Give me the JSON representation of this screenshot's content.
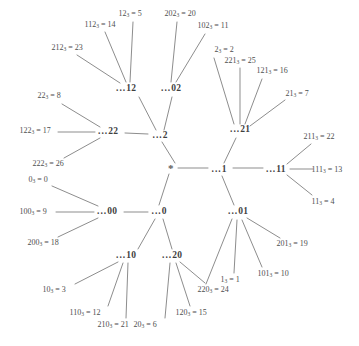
{
  "diagram": {
    "root": {
      "label": "*",
      "x": 171,
      "y": 168
    },
    "line_color": "#8d8d8d",
    "text_color": "#4b4b4b",
    "nodes": [
      {
        "name": "node-2",
        "dots": "...",
        "digits": "2",
        "x": 160,
        "y": 136
      },
      {
        "name": "node-22",
        "dots": "...",
        "digits": "22",
        "x": 108,
        "y": 132
      },
      {
        "name": "node-12",
        "dots": "...",
        "digits": "12",
        "x": 126,
        "y": 89
      },
      {
        "name": "node-02",
        "dots": "...",
        "digits": "02",
        "x": 171,
        "y": 89
      },
      {
        "name": "node-1",
        "dots": "...",
        "digits": "1",
        "x": 219,
        "y": 170
      },
      {
        "name": "node-21",
        "dots": "...",
        "digits": "21",
        "x": 240,
        "y": 130
      },
      {
        "name": "node-11",
        "dots": "...",
        "digits": "11",
        "x": 276,
        "y": 170
      },
      {
        "name": "node-01",
        "dots": "...",
        "digits": "01",
        "x": 238,
        "y": 212
      },
      {
        "name": "node-0",
        "dots": "...",
        "digits": "0",
        "x": 159,
        "y": 212
      },
      {
        "name": "node-00",
        "dots": "...",
        "digits": "00",
        "x": 107,
        "y": 212
      },
      {
        "name": "node-10",
        "dots": "...",
        "digits": "10",
        "x": 126,
        "y": 256
      },
      {
        "name": "node-20",
        "dots": "...",
        "digits": "20",
        "x": 172,
        "y": 256
      }
    ],
    "leaves": [
      {
        "name": "leaf-12",
        "base": "12",
        "value": "5",
        "x": 130,
        "y": 14,
        "anchor": "mid"
      },
      {
        "name": "leaf-112",
        "base": "112",
        "value": "14",
        "x": 100,
        "y": 25,
        "anchor": "mid"
      },
      {
        "name": "leaf-212",
        "base": "212",
        "value": "23",
        "x": 67,
        "y": 48,
        "anchor": "mid"
      },
      {
        "name": "leaf-202",
        "base": "202",
        "value": "20",
        "x": 180,
        "y": 14,
        "anchor": "mid"
      },
      {
        "name": "leaf-102",
        "base": "102",
        "value": "11",
        "x": 213,
        "y": 26,
        "anchor": "mid"
      },
      {
        "name": "leaf-2",
        "base": "2",
        "value": "2",
        "x": 224,
        "y": 50,
        "anchor": "mid"
      },
      {
        "name": "leaf-221",
        "base": "221",
        "value": "25",
        "x": 240,
        "y": 61,
        "anchor": "mid"
      },
      {
        "name": "leaf-121",
        "base": "121",
        "value": "16",
        "x": 272,
        "y": 71,
        "anchor": "mid"
      },
      {
        "name": "leaf-21",
        "base": "21",
        "value": "7",
        "x": 297,
        "y": 94,
        "anchor": "mid"
      },
      {
        "name": "leaf-22",
        "base": "22",
        "value": "8",
        "x": 49,
        "y": 96,
        "anchor": "mid"
      },
      {
        "name": "leaf-122",
        "base": "122",
        "value": "17",
        "x": 35,
        "y": 131,
        "anchor": "mid"
      },
      {
        "name": "leaf-222",
        "base": "222",
        "value": "26",
        "x": 48,
        "y": 164,
        "anchor": "mid"
      },
      {
        "name": "leaf-211",
        "base": "211",
        "value": "22",
        "x": 319,
        "y": 137,
        "anchor": "mid"
      },
      {
        "name": "leaf-111",
        "base": "111",
        "value": "13",
        "x": 327,
        "y": 170,
        "anchor": "mid"
      },
      {
        "name": "leaf-11",
        "base": "11",
        "value": "4",
        "x": 323,
        "y": 202,
        "anchor": "mid"
      },
      {
        "name": "leaf-0",
        "base": "0",
        "value": "0",
        "x": 38,
        "y": 180,
        "anchor": "mid"
      },
      {
        "name": "leaf-100",
        "base": "100",
        "value": "9",
        "x": 33,
        "y": 212,
        "anchor": "mid"
      },
      {
        "name": "leaf-200",
        "base": "200",
        "value": "18",
        "x": 43,
        "y": 243,
        "anchor": "mid"
      },
      {
        "name": "leaf-201",
        "base": "201",
        "value": "19",
        "x": 292,
        "y": 244,
        "anchor": "mid"
      },
      {
        "name": "leaf-101",
        "base": "101",
        "value": "10",
        "x": 273,
        "y": 274,
        "anchor": "mid"
      },
      {
        "name": "leaf-1",
        "base": "1",
        "value": "1",
        "x": 230,
        "y": 280,
        "anchor": "mid"
      },
      {
        "name": "leaf-220",
        "base": "220",
        "value": "24",
        "x": 213,
        "y": 290,
        "anchor": "mid"
      },
      {
        "name": "leaf-120",
        "base": "120",
        "value": "15",
        "x": 191,
        "y": 313,
        "anchor": "mid"
      },
      {
        "name": "leaf-20",
        "base": "20",
        "value": "6",
        "x": 145,
        "y": 325,
        "anchor": "mid"
      },
      {
        "name": "leaf-210",
        "base": "210",
        "value": "21",
        "x": 113,
        "y": 325,
        "anchor": "mid"
      },
      {
        "name": "leaf-110",
        "base": "110",
        "value": "12",
        "x": 85,
        "y": 313,
        "anchor": "mid"
      },
      {
        "name": "leaf-10",
        "base": "10",
        "value": "3",
        "x": 54,
        "y": 290,
        "anchor": "mid"
      }
    ],
    "edges": [
      {
        "from": "root",
        "to": "node-2",
        "x1": 175,
        "y1": 163,
        "x2": 162,
        "y2": 142
      },
      {
        "from": "root",
        "to": "node-1",
        "x1": 178,
        "y1": 168,
        "x2": 208,
        "y2": 168
      },
      {
        "from": "root",
        "to": "node-0",
        "x1": 169,
        "y1": 174,
        "x2": 159,
        "y2": 205
      },
      {
        "from": "node-2",
        "to": "node-22",
        "x1": 148,
        "y1": 134,
        "x2": 125,
        "y2": 133
      },
      {
        "from": "node-2",
        "to": "node-12",
        "x1": 156,
        "y1": 130,
        "x2": 139,
        "y2": 97
      },
      {
        "from": "node-2",
        "to": "node-02",
        "x1": 164,
        "y1": 130,
        "x2": 172,
        "y2": 97
      },
      {
        "from": "node-1",
        "to": "node-21",
        "x1": 224,
        "y1": 163,
        "x2": 236,
        "y2": 138
      },
      {
        "from": "node-1",
        "to": "node-11",
        "x1": 233,
        "y1": 168,
        "x2": 263,
        "y2": 168
      },
      {
        "from": "node-1",
        "to": "node-01",
        "x1": 222,
        "y1": 176,
        "x2": 234,
        "y2": 205
      },
      {
        "from": "node-0",
        "to": "node-00",
        "x1": 148,
        "y1": 212,
        "x2": 124,
        "y2": 212
      },
      {
        "from": "node-0",
        "to": "node-10",
        "x1": 155,
        "y1": 219,
        "x2": 138,
        "y2": 249
      },
      {
        "from": "node-0",
        "to": "node-20",
        "x1": 163,
        "y1": 219,
        "x2": 172,
        "y2": 249
      },
      {
        "from": "node-12",
        "to": "leaf-12",
        "x1": 130,
        "y1": 82,
        "x2": 133,
        "y2": 22
      },
      {
        "from": "node-12",
        "to": "leaf-112",
        "x1": 126,
        "y1": 82,
        "x2": 105,
        "y2": 32
      },
      {
        "from": "node-12",
        "to": "leaf-212",
        "x1": 120,
        "y1": 83,
        "x2": 77,
        "y2": 55
      },
      {
        "from": "node-02",
        "to": "leaf-202",
        "x1": 171,
        "y1": 82,
        "x2": 177,
        "y2": 22
      },
      {
        "from": "node-02",
        "to": "leaf-102",
        "x1": 176,
        "y1": 82,
        "x2": 205,
        "y2": 34
      },
      {
        "from": "node-22",
        "to": "leaf-22",
        "x1": 100,
        "y1": 127,
        "x2": 62,
        "y2": 104
      },
      {
        "from": "node-22",
        "to": "leaf-122",
        "x1": 95,
        "y1": 132,
        "x2": 58,
        "y2": 132
      },
      {
        "from": "node-22",
        "to": "leaf-222",
        "x1": 100,
        "y1": 138,
        "x2": 64,
        "y2": 158
      },
      {
        "from": "node-21",
        "to": "leaf-2",
        "x1": 234,
        "y1": 124,
        "x2": 214,
        "y2": 58
      },
      {
        "from": "node-21",
        "to": "leaf-221",
        "x1": 240,
        "y1": 124,
        "x2": 240,
        "y2": 68
      },
      {
        "from": "node-21",
        "to": "leaf-121",
        "x1": 245,
        "y1": 124,
        "x2": 262,
        "y2": 79
      },
      {
        "from": "node-21",
        "to": "leaf-21",
        "x1": 250,
        "y1": 126,
        "x2": 285,
        "y2": 100
      },
      {
        "from": "node-11",
        "to": "leaf-211",
        "x1": 287,
        "y1": 164,
        "x2": 311,
        "y2": 144
      },
      {
        "from": "node-11",
        "to": "leaf-111",
        "x1": 290,
        "y1": 169,
        "x2": 313,
        "y2": 169
      },
      {
        "from": "node-11",
        "to": "leaf-11",
        "x1": 287,
        "y1": 175,
        "x2": 312,
        "y2": 195
      },
      {
        "from": "node-00",
        "to": "leaf-0",
        "x1": 98,
        "y1": 206,
        "x2": 52,
        "y2": 186
      },
      {
        "from": "node-00",
        "to": "leaf-100",
        "x1": 94,
        "y1": 212,
        "x2": 56,
        "y2": 212
      },
      {
        "from": "node-00",
        "to": "leaf-200",
        "x1": 98,
        "y1": 218,
        "x2": 58,
        "y2": 237
      },
      {
        "from": "node-01",
        "to": "leaf-201",
        "x1": 247,
        "y1": 218,
        "x2": 280,
        "y2": 238
      },
      {
        "from": "node-01",
        "to": "leaf-101",
        "x1": 242,
        "y1": 220,
        "x2": 262,
        "y2": 267
      },
      {
        "from": "node-01",
        "to": "leaf-1",
        "x1": 237,
        "y1": 220,
        "x2": 234,
        "y2": 273
      },
      {
        "from": "node-01",
        "to": "leaf-220",
        "x1": 232,
        "y1": 219,
        "x2": 206,
        "y2": 284
      },
      {
        "from": "node-20",
        "to": "leaf-220",
        "x1": 180,
        "y1": 262,
        "x2": 205,
        "y2": 283
      },
      {
        "from": "node-20",
        "to": "leaf-120",
        "x1": 176,
        "y1": 263,
        "x2": 190,
        "y2": 306
      },
      {
        "from": "node-20",
        "to": "leaf-20",
        "x1": 170,
        "y1": 263,
        "x2": 165,
        "y2": 318
      },
      {
        "from": "node-10",
        "to": "leaf-210",
        "x1": 128,
        "y1": 263,
        "x2": 126,
        "y2": 318
      },
      {
        "from": "node-10",
        "to": "leaf-110",
        "x1": 123,
        "y1": 263,
        "x2": 108,
        "y2": 306
      },
      {
        "from": "node-10",
        "to": "leaf-10",
        "x1": 118,
        "y1": 262,
        "x2": 75,
        "y2": 284
      }
    ]
  }
}
